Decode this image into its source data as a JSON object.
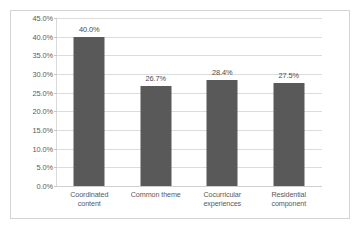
{
  "chart_data": {
    "type": "bar",
    "title": "",
    "xlabel": "",
    "ylabel": "",
    "categories": [
      "Coordinated content",
      "Common theme",
      "Cocurricular experiences",
      "Residential component"
    ],
    "category_lines": [
      [
        "Coordinated",
        "content"
      ],
      [
        "Common theme"
      ],
      [
        "Cocurricular",
        "experiences"
      ],
      [
        "Residential",
        "component"
      ]
    ],
    "values": [
      40.0,
      26.7,
      28.4,
      27.5
    ],
    "data_labels": [
      "40.0%",
      "26.7%",
      "28.4%",
      "27.5%"
    ],
    "ylim": [
      0,
      45
    ],
    "ytick_step": 5,
    "ytick_labels": [
      "45.0%",
      "40.0%",
      "35.0%",
      "30.0%",
      "25.0%",
      "20.0%",
      "15.0%",
      "10.0%",
      "5.0%",
      "0.0%"
    ],
    "ytick_values": [
      45,
      40,
      35,
      30,
      25,
      20,
      15,
      10,
      5,
      0
    ],
    "grid": true,
    "legend": false,
    "colors": {
      "bar": "#595959",
      "gridline": "#dcdcdc",
      "border": "#d4d4d4",
      "text": "#5a5a5a",
      "background": "#ffffff"
    }
  }
}
